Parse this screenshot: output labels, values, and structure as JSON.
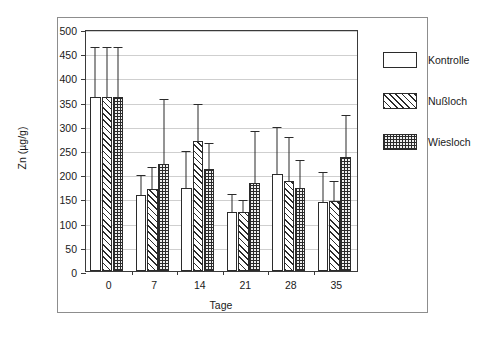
{
  "chart_data": {
    "type": "bar",
    "title": "",
    "xlabel": "Tage",
    "ylabel": "Zn (µg/g)",
    "categories": [
      "0",
      "7",
      "14",
      "21",
      "28",
      "35"
    ],
    "ylim": [
      0,
      500
    ],
    "yticks": [
      0,
      50,
      100,
      150,
      200,
      250,
      300,
      350,
      400,
      450,
      500
    ],
    "ytick_labels": [
      "0",
      "50",
      "100",
      "150",
      "200",
      "250",
      "300",
      "350",
      "400",
      "450",
      "500"
    ],
    "grid": true,
    "grid_axis": "y",
    "legend_position": "right",
    "error_bars": "upper-only",
    "series": [
      {
        "name": "Kontrolle",
        "fill": "white",
        "values": [
          360,
          157,
          172,
          122,
          201,
          142
        ],
        "errors_upper": [
          460,
          197,
          245,
          158,
          295,
          203
        ]
      },
      {
        "name": "Nußloch",
        "fill": "diagonal-hatch",
        "values": [
          360,
          170,
          268,
          122,
          186,
          144
        ],
        "errors_upper": [
          460,
          212,
          342,
          145,
          274,
          184
        ]
      },
      {
        "name": "Wiesloch",
        "fill": "checker-dot",
        "values": [
          360,
          221,
          211,
          181,
          172,
          235
        ],
        "errors_upper": [
          460,
          354,
          262,
          288,
          228,
          321
        ]
      }
    ]
  },
  "axis": {
    "y_title": "Zn (µg/g)",
    "x_title": "Tage"
  },
  "legend": {
    "items": [
      {
        "label": "Kontrolle",
        "swatch": "white-swatch"
      },
      {
        "label": "Nußloch",
        "swatch": "hatch-swatch"
      },
      {
        "label": "Wiesloch",
        "swatch": "checker-swatch"
      }
    ]
  },
  "colors": {
    "ink": "#2b2b2b",
    "grid": "#cfcfcf",
    "frame": "#8d8d8d",
    "background": "#ffffff"
  }
}
